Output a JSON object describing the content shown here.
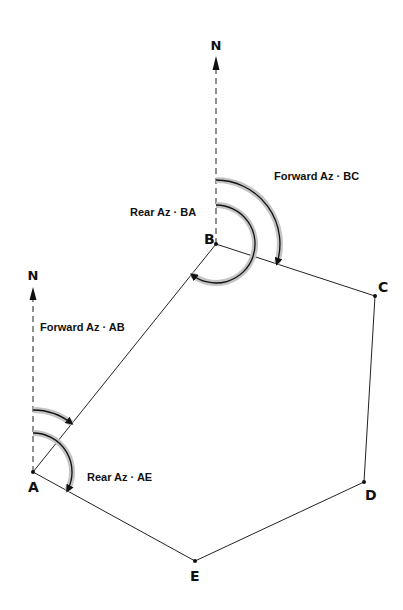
{
  "diagram": {
    "title": "",
    "points": [
      {
        "id": "A",
        "label": "A",
        "x": 33,
        "y": 472
      },
      {
        "id": "B",
        "label": "B",
        "x": 216,
        "y": 244
      },
      {
        "id": "C",
        "label": "C",
        "x": 375,
        "y": 296
      },
      {
        "id": "D",
        "label": "D",
        "x": 364,
        "y": 482
      },
      {
        "id": "E",
        "label": "E",
        "x": 195,
        "y": 561
      }
    ],
    "north_markers": [
      {
        "at": "B",
        "label": "N"
      },
      {
        "at": "A",
        "label": "N"
      }
    ],
    "angle_labels": {
      "forward_az_bc": "Forward Az · BC",
      "rear_az_ba": "Rear Az · BA",
      "forward_az_ab": "Forward Az · AB",
      "rear_az_ae": "Rear Az · AE"
    },
    "colors": {
      "line": "#111111",
      "arc_glow": "#bdbdbd"
    }
  }
}
